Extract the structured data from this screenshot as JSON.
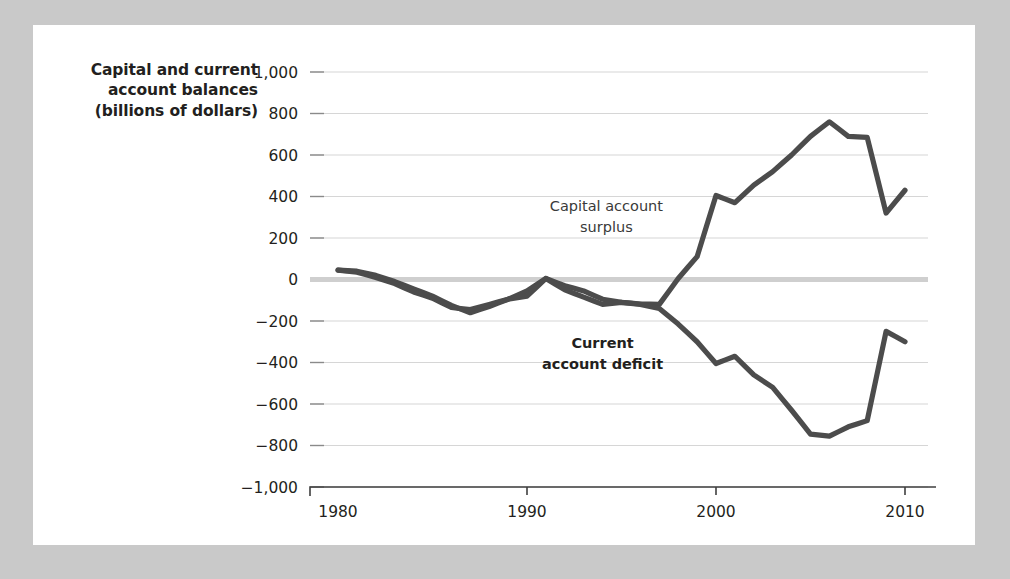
{
  "figure": {
    "background_color": "#c9c9c9",
    "card_color": "#ffffff",
    "axis_title_line1": "Capital and current",
    "axis_title_line2": "account balances",
    "axis_title_line3": "(billions of dollars)"
  },
  "chart_data": {
    "type": "line",
    "title": "",
    "xlabel": "",
    "ylabel": "Capital and current account balances (billions of dollars)",
    "xlim": [
      1980,
      2010
    ],
    "ylim": [
      -1000,
      1000
    ],
    "grid": true,
    "legend_position": "inline-annotations",
    "line_color": "#4c4c4c",
    "zero_line_color": "#cfcfcf",
    "gridline_color": "#d6d6d6",
    "y_ticks": [
      1000,
      800,
      600,
      400,
      200,
      0,
      -200,
      -400,
      -600,
      -800,
      -1000
    ],
    "y_tick_labels": [
      "1,000",
      "800",
      "600",
      "400",
      "200",
      "0",
      "−200",
      "−400",
      "−600",
      "−800",
      "−1,000"
    ],
    "x_ticks": [
      1980,
      1990,
      2000,
      2010
    ],
    "x_tick_labels": [
      "1980",
      "1990",
      "2000",
      "2010"
    ],
    "x": [
      1980,
      1981,
      1982,
      1983,
      1984,
      1985,
      1986,
      1987,
      1988,
      1989,
      1990,
      1991,
      1992,
      1993,
      1994,
      1995,
      1996,
      1997,
      1998,
      1999,
      2000,
      2001,
      2002,
      2003,
      2004,
      2005,
      2006,
      2007,
      2008,
      2009,
      2010
    ],
    "series": [
      {
        "name": "Capital account surplus",
        "annotation": "Capital account\nsurplus",
        "annotation_line1": "Capital account",
        "annotation_line2": "surplus",
        "values": [
          45,
          40,
          20,
          -10,
          -45,
          -80,
          -125,
          -160,
          -130,
          -95,
          -55,
          5,
          -30,
          -55,
          -95,
          -110,
          -118,
          -120,
          5,
          110,
          405,
          370,
          455,
          520,
          600,
          690,
          760,
          690,
          685,
          320,
          430
        ]
      },
      {
        "name": "Current account deficit",
        "annotation": "Current account deficit",
        "annotation_line1": "Current",
        "annotation_line2": "account deficit",
        "values": [
          45,
          35,
          10,
          -20,
          -60,
          -90,
          -135,
          -145,
          -120,
          -95,
          -80,
          5,
          -50,
          -85,
          -120,
          -110,
          -120,
          -140,
          -215,
          -300,
          -405,
          -370,
          -460,
          -520,
          -630,
          -745,
          -755,
          -710,
          -680,
          -250,
          -300
        ]
      }
    ],
    "annotations": [
      {
        "text_line1": "Capital account",
        "text_line2": "surplus",
        "x": 1994.2,
        "y": 330,
        "bold": false
      },
      {
        "text_line1": "Current",
        "text_line2": "account deficit",
        "x": 1994.0,
        "y": -330,
        "bold": true
      }
    ]
  }
}
